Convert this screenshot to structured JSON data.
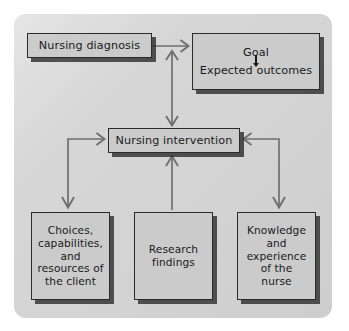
{
  "figure": {
    "panel_color": "#d4d4d4",
    "node_fill": "#cbcbcb",
    "node_border": "#2b2b2b",
    "arrow_color": "#6a6a6a",
    "text_color": "#1a1a1a"
  },
  "nodes": {
    "diagnosis": {
      "label": "Nursing diagnosis"
    },
    "goal": {
      "top_label": "Goal",
      "bottom_label": "Expected outcomes",
      "inner_arrow": "down-arrow-icon"
    },
    "intervention": {
      "label": "Nursing intervention"
    },
    "choices": {
      "lines": [
        "Choices,",
        "capabilities,",
        "and",
        "resources of",
        "the client"
      ]
    },
    "research": {
      "lines": [
        "Research",
        "findings"
      ]
    },
    "knowledge": {
      "lines": [
        "Knowledge",
        "and",
        "experience",
        "of the",
        "nurse"
      ]
    }
  },
  "connectors": [
    {
      "id": "diagnosis-to-goal",
      "from": "diagnosis",
      "to": "goal",
      "style": "single-arrow-right"
    },
    {
      "id": "goal-intervention-link",
      "from": "diagnosis-goal-link",
      "to": "intervention",
      "style": "double-arrow-vertical"
    },
    {
      "id": "choices-to-intervention",
      "from": "choices",
      "to": "intervention",
      "style": "elbow-arrow-both-ends"
    },
    {
      "id": "research-to-intervention",
      "from": "research",
      "to": "intervention",
      "style": "single-arrow-up"
    },
    {
      "id": "knowledge-to-intervention",
      "from": "knowledge",
      "to": "intervention",
      "style": "elbow-arrow-both-ends"
    }
  ]
}
